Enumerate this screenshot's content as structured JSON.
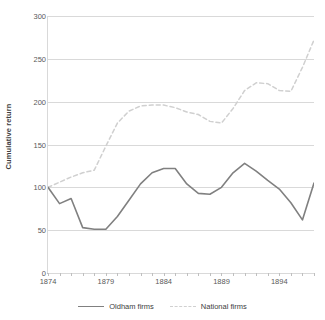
{
  "chart_data": {
    "type": "line",
    "title": "",
    "xlabel": "",
    "ylabel": "Cumulative return",
    "xlim": [
      1874,
      1897
    ],
    "ylim": [
      0,
      300
    ],
    "grid": "horizontal",
    "legend_position": "bottom",
    "y_ticks": [
      0,
      50,
      100,
      150,
      200,
      250,
      300
    ],
    "x_ticks": [
      1874,
      1879,
      1884,
      1889,
      1894
    ],
    "x": [
      1874,
      1875,
      1876,
      1877,
      1878,
      1879,
      1880,
      1881,
      1882,
      1883,
      1884,
      1885,
      1886,
      1887,
      1888,
      1889,
      1890,
      1891,
      1892,
      1893,
      1894,
      1895,
      1896,
      1897
    ],
    "series": [
      {
        "name": "Oldham firms",
        "style": "solid",
        "color": "#808080",
        "values": [
          100,
          81,
          87,
          53,
          51,
          51,
          66,
          85,
          104,
          117,
          122,
          122,
          104,
          93,
          92,
          100,
          117,
          128,
          119,
          108,
          98,
          82,
          62,
          105
        ]
      },
      {
        "name": "National firms",
        "style": "dashed",
        "color": "#d0d0d0",
        "values": [
          100,
          106,
          112,
          117,
          120,
          148,
          175,
          189,
          195,
          196,
          196,
          193,
          188,
          185,
          177,
          175,
          192,
          213,
          222,
          221,
          213,
          212,
          240,
          272
        ]
      }
    ]
  },
  "legend": {
    "items": [
      {
        "label": "Oldham firms"
      },
      {
        "label": "National firms"
      }
    ]
  },
  "axis": {
    "y_title": "Cumulative return"
  }
}
